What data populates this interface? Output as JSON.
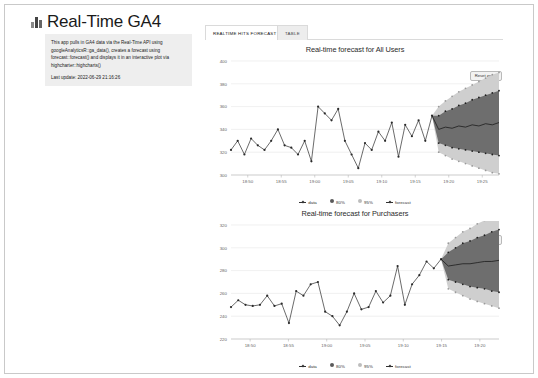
{
  "header": {
    "title": "Real-Time GA4",
    "emoji_icon": "bar-chart-emoji"
  },
  "info_panel": {
    "description": "This app pulls in GA4 data via the Real-Time API using googleAnalyticsR::ga_data(), creates a forecast using forecast::forecast() and displays it in an interactive plot via highcharter::highcharts()",
    "last_update": "Last update: 2022-06-29 21:16:26"
  },
  "tabs": [
    {
      "label": "REALTIME HITS FORECAST",
      "active": true
    },
    {
      "label": "TABLE",
      "active": false
    }
  ],
  "buttons": {
    "reset_zoom": "Reset zoom"
  },
  "legend": [
    {
      "label": "data"
    },
    {
      "label": "80%"
    },
    {
      "label": "95%"
    },
    {
      "label": "forecast"
    }
  ],
  "chart_data": [
    {
      "type": "line",
      "title": "Real-time forecast for All Users",
      "xlabel": "",
      "ylabel": "",
      "ylim": [
        300,
        400
      ],
      "yticks": [
        300,
        320,
        340,
        360,
        380,
        400
      ],
      "xticks": [
        "18:50",
        "18:55",
        "19:00",
        "19:05",
        "19:10",
        "19:15",
        "19:20",
        "19:25"
      ],
      "grid": true,
      "legend_position": "bottom",
      "series": [
        {
          "name": "data",
          "values": [
            322,
            330,
            318,
            332,
            326,
            322,
            330,
            340,
            326,
            324,
            318,
            330,
            312,
            360,
            354,
            348,
            358,
            330,
            318,
            306,
            328,
            322,
            338,
            330,
            346,
            316,
            344,
            334,
            348,
            330,
            352
          ]
        },
        {
          "name": "forecast",
          "values": [
            340,
            342,
            341,
            343,
            342,
            344,
            343,
            345,
            344,
            346
          ]
        },
        {
          "name": "80%",
          "lower": [
            328,
            326,
            324,
            323,
            322,
            321,
            320,
            319,
            318,
            317
          ],
          "upper": [
            352,
            356,
            358,
            361,
            363,
            366,
            368,
            370,
            372,
            374
          ]
        },
        {
          "name": "95%",
          "lower": [
            320,
            317,
            314,
            312,
            310,
            308,
            306,
            304,
            302,
            301
          ],
          "upper": [
            360,
            365,
            369,
            373,
            376,
            379,
            382,
            385,
            388,
            390
          ]
        }
      ]
    },
    {
      "type": "line",
      "title": "Real-time forecast for Purchasers",
      "xlabel": "",
      "ylabel": "",
      "ylim": [
        220,
        320
      ],
      "yticks": [
        220,
        240,
        260,
        280,
        300,
        320
      ],
      "xticks": [
        "18:50",
        "18:55",
        "19:00",
        "19:05",
        "19:10",
        "19:15",
        "19:20"
      ],
      "grid": true,
      "legend_position": "bottom",
      "series": [
        {
          "name": "data",
          "values": [
            248,
            254,
            250,
            249,
            250,
            258,
            249,
            251,
            234,
            262,
            258,
            268,
            270,
            244,
            240,
            232,
            244,
            260,
            246,
            248,
            262,
            252,
            258,
            284,
            250,
            268,
            276,
            288,
            282,
            290
          ]
        },
        {
          "name": "forecast",
          "values": [
            284,
            285,
            286,
            286,
            287,
            288,
            288,
            289
          ]
        },
        {
          "name": "80%",
          "lower": [
            272,
            270,
            268,
            266,
            265,
            264,
            262,
            261
          ],
          "upper": [
            296,
            300,
            304,
            306,
            309,
            311,
            314,
            316
          ]
        },
        {
          "name": "95%",
          "lower": [
            264,
            261,
            258,
            255,
            253,
            251,
            249,
            247
          ],
          "upper": [
            304,
            309,
            314,
            317,
            321,
            324,
            327,
            330
          ]
        }
      ]
    }
  ],
  "colors": {
    "band_80": "#6e6e6e",
    "band_95": "#cfcfcf",
    "line": "#2b2b2b",
    "panel_bg": "#eeeeee",
    "frame_border": "#c9c9c9"
  }
}
